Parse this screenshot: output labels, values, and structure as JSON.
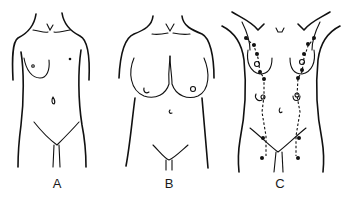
{
  "figures": [
    {
      "id": "A",
      "label": "A",
      "description": "Normal female torso with small breasts"
    },
    {
      "id": "B",
      "label": "B",
      "description": "Female torso with large pendulous breasts"
    },
    {
      "id": "C",
      "label": "C",
      "description": "Female torso showing milk line with accessory nipple locations (dotted line with dots)"
    }
  ],
  "colors": {
    "line": "#111111",
    "background": "#ffffff"
  }
}
